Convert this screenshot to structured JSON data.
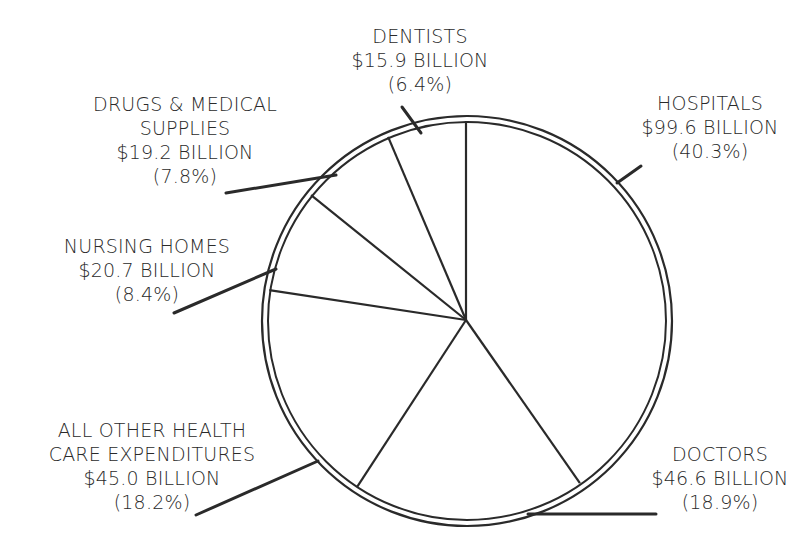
{
  "chart_data": {
    "type": "pie",
    "title": "",
    "unit": "billion USD",
    "start_angle_deg": 0,
    "direction": "clockwise",
    "categories": [
      "Hospitals",
      "Doctors",
      "All Other Health Care Expenditures",
      "Nursing Homes",
      "Drugs & Medical Supplies",
      "Dentists"
    ],
    "values": [
      99.6,
      46.6,
      45.0,
      20.7,
      19.2,
      15.9
    ],
    "percentages": [
      40.3,
      18.9,
      18.2,
      8.4,
      7.8,
      6.4
    ],
    "slices": [
      {
        "name": "Hospitals",
        "value": 99.6,
        "percent": 40.3,
        "label_lines": [
          "HOSPITALS",
          "$99.6 BILLION",
          "(40.3%)"
        ]
      },
      {
        "name": "Doctors",
        "value": 46.6,
        "percent": 18.9,
        "label_lines": [
          "DOCTORS",
          "$46.6 BILLION",
          "(18.9%)"
        ]
      },
      {
        "name": "All Other Health Care Expenditures",
        "value": 45.0,
        "percent": 18.2,
        "label_lines": [
          "ALL OTHER HEALTH",
          "CARE EXPENDITURES",
          "$45.0 BILLION",
          "(18.2%)"
        ]
      },
      {
        "name": "Nursing Homes",
        "value": 20.7,
        "percent": 8.4,
        "label_lines": [
          "NURSING HOMES",
          "$20.7 BILLION",
          "(8.4%)"
        ]
      },
      {
        "name": "Drugs & Medical Supplies",
        "value": 19.2,
        "percent": 7.8,
        "label_lines": [
          "DRUGS & MEDICAL",
          "SUPPLIES",
          "$19.2 BILLION",
          "(7.8%)"
        ]
      },
      {
        "name": "Dentists",
        "value": 15.9,
        "percent": 6.4,
        "label_lines": [
          "DENTISTS",
          "$15.9 BILLION",
          "(6.4%)"
        ]
      }
    ],
    "legend": "none (callout labels)",
    "colors": {
      "stroke": "#2a2a2a",
      "fill": "#ffffff",
      "text": "#2a2a2a"
    }
  },
  "labels": {
    "hospitals": {
      "l1": "HOSPITALS",
      "l2": "$99.6 BILLION",
      "l3": "(40.3%)"
    },
    "doctors": {
      "l1": "DOCTORS",
      "l2": "$46.6 BILLION",
      "l3": "(18.9%)"
    },
    "all_other": {
      "l1": "ALL OTHER HEALTH",
      "l2": "CARE EXPENDITURES",
      "l3": "$45.0 BILLION",
      "l4": "(18.2%)"
    },
    "nursing": {
      "l1": "NURSING HOMES",
      "l2": "$20.7 BILLION",
      "l3": "(8.4%)"
    },
    "drugs": {
      "l1": "DRUGS & MEDICAL",
      "l2": "SUPPLIES",
      "l3": "$19.2 BILLION",
      "l4": "(7.8%)"
    },
    "dentists": {
      "l1": "DENTISTS",
      "l2": "$15.9 BILLION",
      "l3": "(6.4%)"
    }
  }
}
